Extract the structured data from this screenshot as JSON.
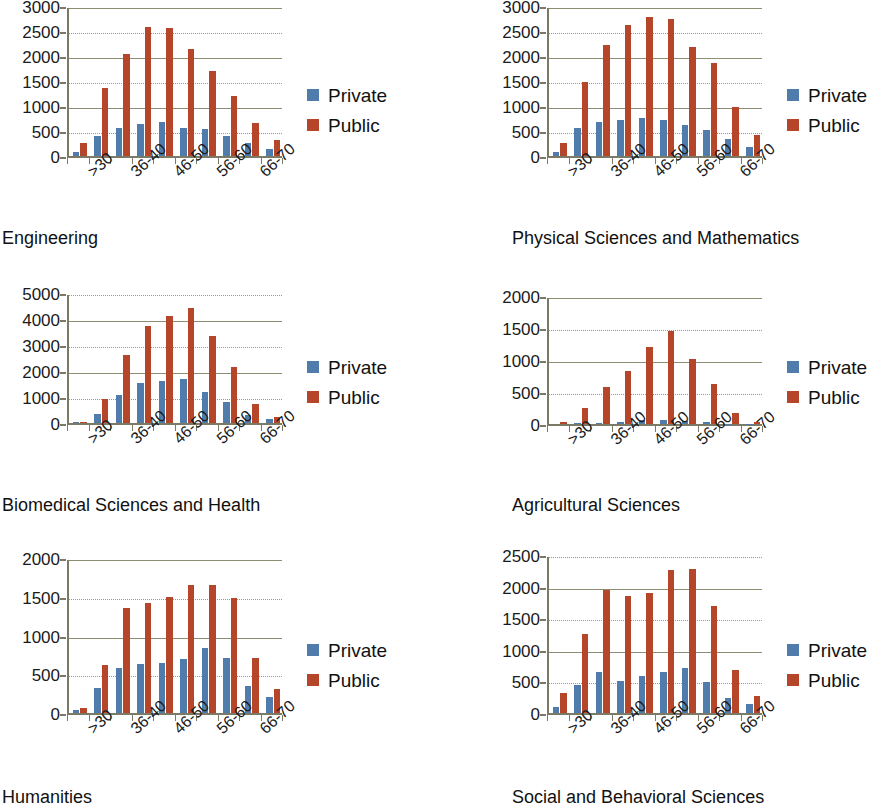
{
  "figure": {
    "series_names": [
      "Private",
      "Public"
    ],
    "colors": {
      "private": "#4f7cab",
      "public": "#b5462a",
      "axis": "#7a7a66",
      "grid": "#8d8d72",
      "text": "#111111"
    },
    "categories": [
      ">30",
      "31-35",
      "36-40",
      "41-45",
      "46-50",
      "51-55",
      "56-60",
      "61-65",
      "66-70"
    ],
    "visible_tick_labels": [
      ">30",
      "36-40",
      "46-50",
      "56-60",
      "66-70"
    ],
    "legend": {
      "private_label": "Private",
      "public_label": "Public"
    }
  },
  "chart_data": [
    {
      "type": "bar",
      "title": "Engineering",
      "xlabel": "",
      "ylabel": "",
      "categories": [
        ">30",
        "31-35",
        "36-40",
        "41-45",
        "46-50",
        "51-55",
        "56-60",
        "61-65",
        "66-70"
      ],
      "series": [
        {
          "name": "Private",
          "values": [
            75,
            400,
            565,
            640,
            690,
            565,
            540,
            395,
            265,
            140
          ]
        },
        {
          "name": "Public",
          "values": [
            270,
            1355,
            2040,
            2590,
            2560,
            2150,
            1710,
            1205,
            665,
            330
          ]
        }
      ],
      "ylim": [
        0,
        3000
      ],
      "yticks": [
        0,
        500,
        1000,
        1500,
        2000,
        2500,
        3000
      ],
      "grid": true,
      "legend_position": "right"
    },
    {
      "type": "bar",
      "title": "Physical Sciences and Mathematics",
      "xlabel": "",
      "ylabel": "",
      "categories": [
        ">30",
        "31-35",
        "36-40",
        "41-45",
        "46-50",
        "51-55",
        "56-60",
        "61-65",
        "66-70"
      ],
      "series": [
        {
          "name": "Private",
          "values": [
            85,
            570,
            680,
            720,
            760,
            730,
            630,
            520,
            340,
            190
          ]
        },
        {
          "name": "Public",
          "values": [
            255,
            1490,
            2230,
            2625,
            2775,
            2740,
            2185,
            1860,
            980,
            425
          ]
        }
      ],
      "ylim": [
        0,
        3000
      ],
      "yticks": [
        0,
        500,
        1000,
        1500,
        2000,
        2500,
        3000
      ],
      "grid": true,
      "legend_position": "right"
    },
    {
      "type": "bar",
      "title": "Biomedical Sciences and Health",
      "xlabel": "",
      "ylabel": "",
      "categories": [
        ">30",
        "31-35",
        "36-40",
        "41-45",
        "46-50",
        "51-55",
        "56-60",
        "61-65",
        "66-70"
      ],
      "series": [
        {
          "name": "Private",
          "values": [
            30,
            360,
            1075,
            1550,
            1600,
            1710,
            1190,
            790,
            290,
            150
          ]
        },
        {
          "name": "Public",
          "values": [
            40,
            930,
            2620,
            3750,
            4110,
            4420,
            3350,
            2170,
            730,
            240
          ]
        }
      ],
      "ylim": [
        0,
        5000
      ],
      "yticks": [
        0,
        1000,
        2000,
        3000,
        4000,
        5000
      ],
      "grid": true,
      "legend_position": "right"
    },
    {
      "type": "bar",
      "title": "Agricultural Sciences",
      "xlabel": "",
      "ylabel": "",
      "categories": [
        ">30",
        "31-35",
        "36-40",
        "41-45",
        "46-50",
        "51-55",
        "56-60",
        "61-65",
        "66-70"
      ],
      "series": [
        {
          "name": "Private",
          "values": [
            0,
            10,
            15,
            35,
            55,
            55,
            50,
            25,
            5,
            5
          ]
        },
        {
          "name": "Public",
          "values": [
            25,
            255,
            585,
            830,
            1210,
            1460,
            1015,
            625,
            175,
            35
          ]
        }
      ],
      "ylim": [
        0,
        2000
      ],
      "yticks": [
        0,
        500,
        1000,
        1500,
        2000
      ],
      "grid": true,
      "legend_position": "right"
    },
    {
      "type": "bar",
      "title": "Humanities",
      "xlabel": "",
      "ylabel": "",
      "categories": [
        ">30",
        "31-35",
        "36-40",
        "41-45",
        "46-50",
        "51-55",
        "56-60",
        "61-65",
        "66-70"
      ],
      "series": [
        {
          "name": "Private",
          "values": [
            40,
            320,
            585,
            635,
            650,
            700,
            845,
            705,
            355,
            210
          ]
        },
        {
          "name": "Public",
          "values": [
            70,
            615,
            1350,
            1420,
            1495,
            1655,
            1650,
            1485,
            715,
            305
          ]
        }
      ],
      "ylim": [
        0,
        2000
      ],
      "yticks": [
        0,
        500,
        1000,
        1500,
        2000
      ],
      "grid": true,
      "legend_position": "right"
    },
    {
      "type": "bar",
      "title": "Social and Behavioral Sciences",
      "xlabel": "",
      "ylabel": "",
      "categories": [
        ">30",
        "31-35",
        "36-40",
        "41-45",
        "46-50",
        "51-55",
        "56-60",
        "61-65",
        "66-70"
      ],
      "series": [
        {
          "name": "Private",
          "values": [
            95,
            450,
            645,
            500,
            580,
            655,
            715,
            485,
            230,
            140
          ]
        },
        {
          "name": "Public",
          "values": [
            310,
            1250,
            1940,
            1855,
            1900,
            2270,
            2275,
            1690,
            680,
            275
          ]
        }
      ],
      "ylim": [
        0,
        2500
      ],
      "yticks": [
        0,
        500,
        1000,
        1500,
        2000,
        2500
      ],
      "grid": true,
      "legend_position": "right"
    }
  ]
}
